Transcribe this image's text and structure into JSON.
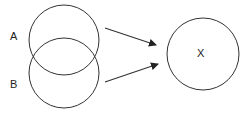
{
  "diagram": {
    "stroke_color": "#333333",
    "nodes": [
      {
        "id": "A",
        "label": "A",
        "shape": "circle",
        "cx": 64,
        "cy": 40,
        "r": 35
      },
      {
        "id": "B",
        "label": "B",
        "shape": "circle",
        "cx": 64,
        "cy": 73,
        "r": 35
      },
      {
        "id": "X",
        "label": "X",
        "shape": "circle",
        "cx": 203,
        "cy": 54,
        "r": 36
      }
    ],
    "edges": [
      {
        "from": "A",
        "to": "X"
      },
      {
        "from": "B",
        "to": "X"
      }
    ],
    "labels": {
      "a": "A",
      "b": "B",
      "x": "X"
    }
  }
}
